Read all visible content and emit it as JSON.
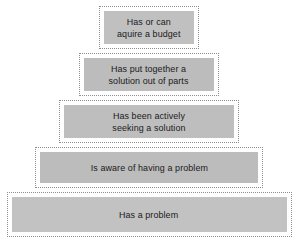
{
  "diagram": {
    "type": "pyramid",
    "orientation": "apex-top",
    "level_count": 5,
    "fill_color": "#bdbdbd",
    "border_style": "dotted",
    "border_color": "#8d8d8d",
    "text_color": "#1b1b1b",
    "background_color": "#ffffff",
    "levels": [
      {
        "rank": 1,
        "position": "top",
        "label": "Has or can\naquire a budget"
      },
      {
        "rank": 2,
        "position": "upper-middle",
        "label": "Has put together a\nsolution out of parts"
      },
      {
        "rank": 3,
        "position": "middle",
        "label": "Has been actively\nseeking a solution"
      },
      {
        "rank": 4,
        "position": "lower-middle",
        "label": "Is aware of having a problem"
      },
      {
        "rank": 5,
        "position": "bottom",
        "label": "Has a problem"
      }
    ]
  }
}
